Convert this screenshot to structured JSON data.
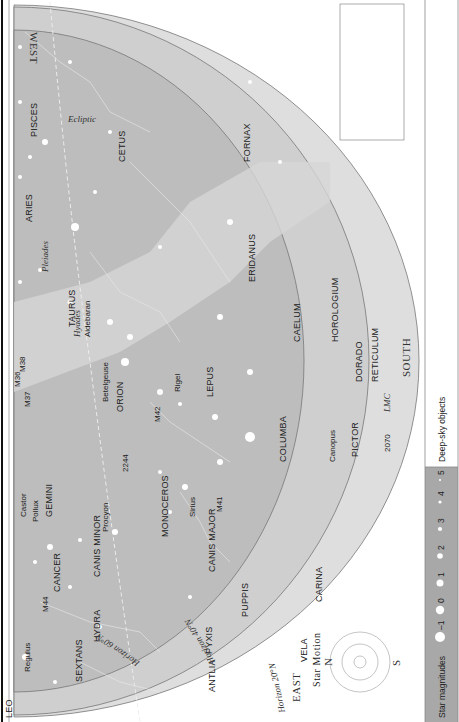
{
  "chart": {
    "directions": {
      "north_top": "WEST",
      "south": "SOUTH",
      "east": "EAST"
    },
    "horizons": [
      "Horizon 60°N",
      "Horizon 40°N",
      "Horizon 20°N"
    ],
    "ecliptic_label": "Ecliptic",
    "latitude_marks": [
      "40°N",
      "N 32",
      "20°N"
    ],
    "constellations": [
      "PISCES",
      "CETUS",
      "ARIES",
      "TAURUS",
      "FORNAX",
      "ERIDANUS",
      "HOROLOGIUM",
      "CAELUM",
      "RETICULUM",
      "DORADO",
      "PICTOR",
      "ORION",
      "LEPUS",
      "COLUMBA",
      "GEMINI",
      "MONOCEROS",
      "CANIS MINOR",
      "CANIS MAJOR",
      "CARINA",
      "PUPPIS",
      "PYXIS",
      "VELA",
      "CANCER",
      "HYDRA",
      "LEO",
      "SEXTANS",
      "ANTLIA"
    ],
    "stars": [
      "Aldebaran",
      "Betelgeuse",
      "Rigel",
      "Sirius",
      "Procyon",
      "Castor",
      "Pollux",
      "Regulus",
      "Canopus"
    ],
    "objects": [
      "Pleiades",
      "Hyades",
      "M36",
      "M37",
      "M38",
      "M42",
      "M41",
      "2244",
      "M44",
      "2070",
      "LMC"
    ]
  },
  "time_table": {
    "headers": [
      "Date",
      "Std Time",
      "DST"
    ],
    "rows": [
      [
        "January 1",
        "11 pm",
        "Midnight"
      ],
      [
        "January 15",
        "10 pm",
        "11 pm"
      ],
      [
        "January 30",
        "9 pm",
        "10 pm"
      ]
    ]
  },
  "star_motion": {
    "title": "Star Motion",
    "north": "N",
    "south": "S"
  },
  "legend": {
    "star_magnitudes_label": "Star magnitudes",
    "magnitudes": [
      "–1",
      "0",
      "1",
      "2",
      "3",
      "4",
      "5"
    ],
    "deep_sky_label": "Deep-sky objects",
    "objects": [
      {
        "line1": "Galaxy",
        "line2": ""
      },
      {
        "line1": "Globular",
        "line2": "cluster"
      },
      {
        "line1": "Open",
        "line2": "cluster"
      },
      {
        "line1": "Diffuse",
        "line2": "nebula"
      },
      {
        "line1": "Planetary",
        "line2": "nebula"
      }
    ]
  }
}
